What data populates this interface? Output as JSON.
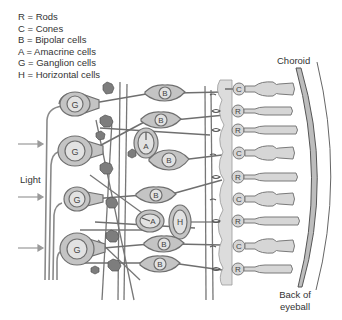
{
  "legend": {
    "items": [
      {
        "key": "R",
        "label": "R = Rods"
      },
      {
        "key": "C",
        "label": "C = Cones"
      },
      {
        "key": "B",
        "label": "B = Bipolar cells"
      },
      {
        "key": "A",
        "label": "A = Amacrine cells"
      },
      {
        "key": "G",
        "label": "G = Ganglion  cells"
      },
      {
        "key": "H",
        "label": "H = Horizontal cells"
      }
    ]
  },
  "labels": {
    "light": "Light",
    "choroid": "Choroid",
    "back_line1": "Back of",
    "back_line2": "eyeball"
  },
  "cells": {
    "ganglion": [
      "G",
      "G",
      "G",
      "G"
    ],
    "bipolar": [
      "B",
      "B",
      "B",
      "B",
      "B",
      "B"
    ],
    "amacrine": [
      "A",
      "A"
    ],
    "horizontal": [
      "H"
    ],
    "photoreceptors": [
      "C",
      "R",
      "R",
      "C",
      "R",
      "C",
      "R",
      "C",
      "R"
    ]
  },
  "colors": {
    "cell_fill": "#c4c4c4",
    "cell_stroke": "#6f6f6f",
    "nucleus_fill": "#e2e2e2",
    "photoreceptor_fill": "#d6d6d6",
    "synapse_dark": "#7a7a7a",
    "choroid_fill": "#bdbdbd",
    "text": "#333333"
  }
}
